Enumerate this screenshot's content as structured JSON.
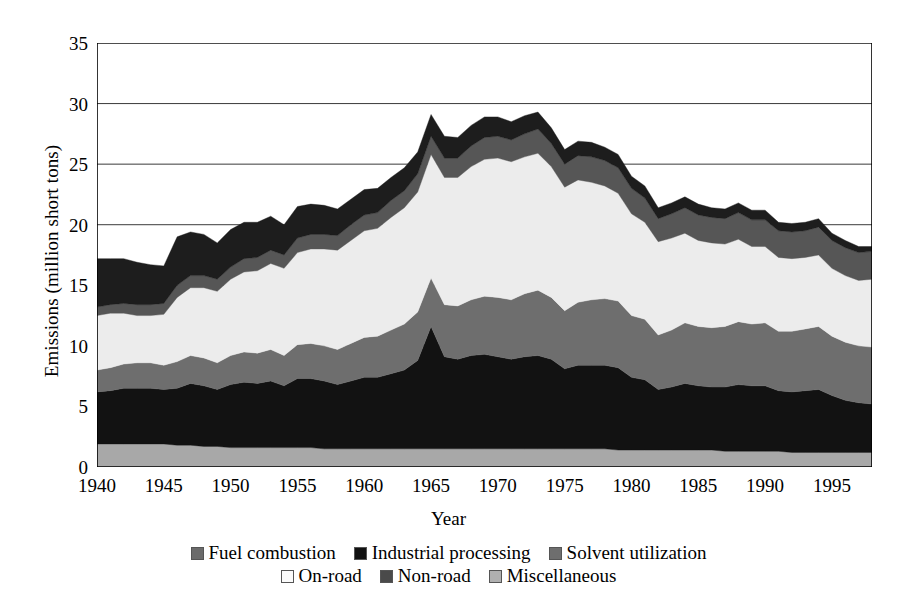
{
  "chart_data": {
    "type": "area",
    "stacked": true,
    "title": "",
    "xlabel": "Year",
    "ylabel": "Emissions (million short tons)",
    "xlim": [
      1940,
      1998
    ],
    "ylim": [
      0,
      35
    ],
    "yticks": [
      0,
      5,
      10,
      15,
      20,
      25,
      30,
      35
    ],
    "ytick_labels": [
      "0",
      "5",
      "10",
      "15",
      "20",
      "25",
      "30",
      "35"
    ],
    "xticks": [
      1940,
      1945,
      1950,
      1955,
      1960,
      1965,
      1970,
      1975,
      1980,
      1985,
      1990,
      1995
    ],
    "xtick_labels": [
      "1940",
      "1945",
      "1950",
      "1955",
      "1960",
      "1965",
      "1970",
      "1975",
      "1980",
      "1985",
      "1990",
      "1995"
    ],
    "x_minor_tick_interval": 1,
    "grid": "horizontal",
    "legend_position": "bottom",
    "x": [
      1940,
      1941,
      1942,
      1943,
      1944,
      1945,
      1946,
      1947,
      1948,
      1949,
      1950,
      1951,
      1952,
      1953,
      1954,
      1955,
      1956,
      1957,
      1958,
      1959,
      1960,
      1961,
      1962,
      1963,
      1964,
      1965,
      1966,
      1967,
      1968,
      1969,
      1970,
      1971,
      1972,
      1973,
      1974,
      1975,
      1976,
      1977,
      1978,
      1979,
      1980,
      1981,
      1982,
      1983,
      1984,
      1985,
      1986,
      1987,
      1988,
      1989,
      1990,
      1991,
      1992,
      1993,
      1994,
      1995,
      1996,
      1997,
      1998
    ],
    "stack_order_bottom_to_top": [
      "Miscellaneous",
      "Industrial processing",
      "Solvent utilization",
      "On-road",
      "Non-road",
      "Fuel combustion"
    ],
    "series": [
      {
        "name": "Miscellaneous",
        "color": "#a8a8a8",
        "values": [
          1.9,
          1.9,
          1.9,
          1.9,
          1.9,
          1.9,
          1.8,
          1.8,
          1.7,
          1.7,
          1.6,
          1.6,
          1.6,
          1.6,
          1.6,
          1.6,
          1.6,
          1.5,
          1.5,
          1.5,
          1.5,
          1.5,
          1.5,
          1.5,
          1.5,
          1.5,
          1.5,
          1.5,
          1.5,
          1.5,
          1.5,
          1.5,
          1.5,
          1.5,
          1.5,
          1.5,
          1.5,
          1.5,
          1.5,
          1.4,
          1.4,
          1.4,
          1.4,
          1.4,
          1.4,
          1.4,
          1.4,
          1.3,
          1.3,
          1.3,
          1.3,
          1.3,
          1.2,
          1.2,
          1.2,
          1.2,
          1.2,
          1.2,
          1.2
        ]
      },
      {
        "name": "Industrial processing",
        "color": "#121212",
        "values": [
          4.3,
          4.4,
          4.6,
          4.6,
          4.6,
          4.5,
          4.7,
          5.1,
          5.0,
          4.7,
          5.2,
          5.4,
          5.3,
          5.5,
          5.1,
          5.7,
          5.7,
          5.6,
          5.3,
          5.6,
          5.9,
          5.9,
          6.2,
          6.5,
          7.3,
          10.1,
          7.6,
          7.4,
          7.7,
          7.8,
          7.6,
          7.4,
          7.6,
          7.7,
          7.4,
          6.6,
          6.9,
          6.9,
          6.9,
          6.8,
          6.0,
          5.8,
          5.0,
          5.2,
          5.5,
          5.3,
          5.2,
          5.3,
          5.5,
          5.4,
          5.4,
          5.0,
          5.0,
          5.1,
          5.2,
          4.7,
          4.3,
          4.1,
          4.0
        ]
      },
      {
        "name": "Solvent utilization",
        "color": "#6e6e6e",
        "values": [
          1.8,
          1.9,
          2.0,
          2.1,
          2.1,
          2.0,
          2.2,
          2.3,
          2.3,
          2.2,
          2.4,
          2.5,
          2.5,
          2.6,
          2.5,
          2.8,
          2.9,
          2.9,
          2.9,
          3.1,
          3.3,
          3.4,
          3.6,
          3.8,
          4.0,
          4.0,
          4.3,
          4.4,
          4.6,
          4.8,
          4.9,
          4.9,
          5.2,
          5.4,
          5.1,
          4.8,
          5.2,
          5.4,
          5.5,
          5.5,
          5.1,
          5.0,
          4.5,
          4.7,
          5.0,
          4.9,
          4.9,
          5.0,
          5.2,
          5.1,
          5.2,
          4.9,
          5.0,
          5.1,
          5.2,
          4.9,
          4.8,
          4.7,
          4.7
        ]
      },
      {
        "name": "On-road",
        "color": "#ececec",
        "values": [
          4.5,
          4.5,
          4.2,
          3.9,
          3.9,
          4.2,
          5.3,
          5.6,
          5.8,
          5.9,
          6.3,
          6.6,
          6.8,
          7.1,
          7.2,
          7.6,
          7.8,
          8.0,
          8.2,
          8.5,
          8.8,
          8.9,
          9.3,
          9.6,
          9.9,
          10.2,
          10.5,
          10.6,
          11.0,
          11.3,
          11.5,
          11.4,
          11.3,
          11.3,
          10.8,
          10.2,
          10.1,
          9.7,
          9.3,
          8.9,
          8.4,
          8.0,
          7.7,
          7.6,
          7.4,
          7.1,
          7.0,
          6.8,
          6.8,
          6.4,
          6.3,
          6.1,
          6.0,
          5.9,
          5.9,
          5.6,
          5.5,
          5.4,
          5.6
        ]
      },
      {
        "name": "Non-road",
        "color": "#565656",
        "values": [
          0.7,
          0.7,
          0.8,
          0.9,
          0.9,
          0.9,
          1.0,
          1.0,
          1.0,
          1.0,
          1.0,
          1.1,
          1.1,
          1.1,
          1.1,
          1.2,
          1.2,
          1.2,
          1.2,
          1.3,
          1.3,
          1.3,
          1.4,
          1.4,
          1.5,
          1.5,
          1.6,
          1.6,
          1.7,
          1.8,
          1.8,
          1.8,
          1.9,
          2.0,
          1.9,
          1.9,
          2.0,
          2.1,
          2.1,
          2.1,
          2.1,
          2.0,
          1.9,
          2.0,
          2.1,
          2.1,
          2.1,
          2.1,
          2.2,
          2.2,
          2.2,
          2.2,
          2.2,
          2.2,
          2.3,
          2.3,
          2.3,
          2.3,
          2.3
        ]
      },
      {
        "name": "Fuel combustion",
        "color": "#1d1d1d",
        "values": [
          4.0,
          3.8,
          3.7,
          3.5,
          3.3,
          3.1,
          4.0,
          3.6,
          3.4,
          3.0,
          3.1,
          3.0,
          2.9,
          2.8,
          2.5,
          2.6,
          2.5,
          2.4,
          2.2,
          2.1,
          2.1,
          2.0,
          1.9,
          1.9,
          1.8,
          1.8,
          1.8,
          1.7,
          1.7,
          1.7,
          1.6,
          1.5,
          1.5,
          1.4,
          1.3,
          1.2,
          1.2,
          1.2,
          1.1,
          1.1,
          1.0,
          1.0,
          0.9,
          0.9,
          0.9,
          0.9,
          0.8,
          0.8,
          0.8,
          0.8,
          0.8,
          0.7,
          0.7,
          0.7,
          0.7,
          0.6,
          0.6,
          0.5,
          0.4
        ]
      }
    ],
    "totals": [
      17.2,
      17.2,
      17.2,
      16.9,
      16.7,
      16.6,
      20.0,
      19.4,
      19.2,
      18.5,
      19.6,
      20.2,
      20.2,
      20.7,
      20.0,
      21.5,
      21.7,
      21.6,
      21.3,
      22.1,
      22.9,
      23.0,
      23.9,
      24.7,
      26.0,
      29.1,
      27.3,
      27.2,
      28.2,
      28.9,
      28.9,
      28.5,
      29.0,
      29.3,
      28.0,
      26.2,
      26.9,
      26.8,
      26.4,
      25.8,
      24.0,
      23.2,
      21.4,
      21.8,
      22.3,
      21.7,
      21.4,
      21.3,
      21.8,
      21.2,
      21.2,
      20.2,
      20.1,
      20.2,
      20.5,
      19.3,
      18.7,
      18.2,
      18.2
    ]
  },
  "axes": {
    "y_title": "Emissions (million short tons)",
    "x_title": "Year"
  },
  "legend": {
    "row1": [
      {
        "label": "Fuel combustion",
        "color": "#6b6b6b"
      },
      {
        "label": "Industrial processing",
        "color": "#111111"
      },
      {
        "label": "Solvent utilization",
        "color": "#6e6e6e"
      }
    ],
    "row2": [
      {
        "label": "On-road",
        "color": "#fbfbfb"
      },
      {
        "label": "Non-road",
        "color": "#4a4a4a"
      },
      {
        "label": "Miscellaneous",
        "color": "#b0b0b0"
      }
    ]
  }
}
